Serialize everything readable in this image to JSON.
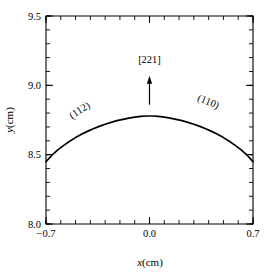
{
  "figure": {
    "background": "#ffffff",
    "frame_color": "#000000",
    "curve_color": "#000000"
  },
  "axes": {
    "x": {
      "label_italic": "x",
      "label_unit": "(cm)",
      "min": -0.7,
      "max": 0.7,
      "ticks": [
        -0.7,
        0.0,
        0.7
      ],
      "tick_labels": [
        "−0.7",
        "0.0",
        "0.7"
      ],
      "minor_tick_step": 0.1
    },
    "y": {
      "label_italic": "y",
      "label_unit": "(cm)",
      "min": 8.0,
      "max": 9.5,
      "ticks": [
        8.0,
        8.5,
        9.0,
        9.5
      ],
      "tick_labels": [
        "8.0",
        "8.5",
        "9.0",
        "9.5"
      ],
      "minor_tick_step": 0.1
    }
  },
  "annotations": {
    "left_facet": {
      "text": "(112)",
      "x": -0.46,
      "y": 8.8,
      "rotation": -33
    },
    "right_facet": {
      "text": "(110)",
      "x": 0.39,
      "y": 8.86,
      "rotation": 22
    },
    "direction": {
      "text": "[221]",
      "x": 0.0,
      "y": 9.16,
      "arrow_from_y": 8.86,
      "arrow_to_y": 9.07
    }
  },
  "chart_data": {
    "type": "line",
    "title": "",
    "xlabel": "x(cm)",
    "ylabel": "y(cm)",
    "xlim": [
      -0.7,
      0.7
    ],
    "ylim": [
      8.0,
      9.5
    ],
    "grid": false,
    "legend": "none",
    "series": [
      {
        "name": "crystal surface profile",
        "x": [
          -0.7,
          -0.66,
          -0.62,
          -0.58,
          -0.54,
          -0.5,
          -0.46,
          -0.42,
          -0.38,
          -0.34,
          -0.3,
          -0.26,
          -0.22,
          -0.18,
          -0.14,
          -0.1,
          -0.06,
          -0.02,
          0.02,
          0.06,
          0.1,
          0.14,
          0.18,
          0.22,
          0.26,
          0.3,
          0.34,
          0.38,
          0.42,
          0.46,
          0.5,
          0.54,
          0.58,
          0.62,
          0.66,
          0.7
        ],
        "y": [
          8.45,
          8.496,
          8.534,
          8.567,
          8.597,
          8.623,
          8.647,
          8.668,
          8.687,
          8.704,
          8.719,
          8.733,
          8.745,
          8.755,
          8.764,
          8.771,
          8.776,
          8.779,
          8.779,
          8.776,
          8.771,
          8.764,
          8.755,
          8.745,
          8.733,
          8.719,
          8.704,
          8.687,
          8.668,
          8.647,
          8.623,
          8.597,
          8.567,
          8.534,
          8.496,
          8.45
        ]
      }
    ],
    "peak": {
      "x": 0.0,
      "y": 8.78
    },
    "endpoints": {
      "left_y": 8.45,
      "right_y": 8.45
    }
  }
}
